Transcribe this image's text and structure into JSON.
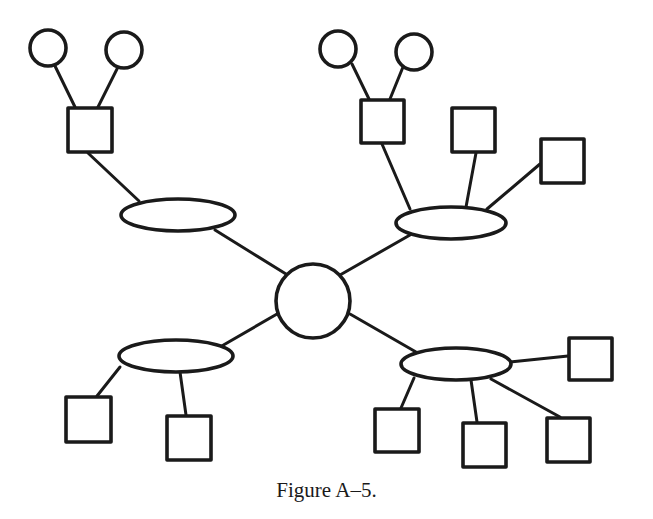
{
  "figure": {
    "caption": "Figure A–5.",
    "stroke_color": "#1a1a1a",
    "background": "#ffffff"
  },
  "diagram": {
    "hub": {
      "id": "hub",
      "shape": "circle",
      "cx": 313,
      "cy": 301,
      "r": 37
    },
    "ellipses": [
      {
        "id": "ellipse-top-left",
        "cx": 178,
        "cy": 215,
        "rx": 57,
        "ry": 16
      },
      {
        "id": "ellipse-top-right",
        "cx": 451,
        "cy": 223,
        "rx": 55,
        "ry": 16
      },
      {
        "id": "ellipse-bottom-left",
        "cx": 176,
        "cy": 356,
        "rx": 57,
        "ry": 16
      },
      {
        "id": "ellipse-bottom-right",
        "cx": 456,
        "cy": 364,
        "rx": 55,
        "ry": 16
      }
    ],
    "squares": [
      {
        "id": "square-tl-1",
        "x": 68,
        "y": 108,
        "w": 44,
        "h": 44
      },
      {
        "id": "square-tr-1",
        "x": 361,
        "y": 100,
        "w": 43,
        "h": 43
      },
      {
        "id": "square-tr-2",
        "x": 452,
        "y": 108,
        "w": 43,
        "h": 44
      },
      {
        "id": "square-tr-3",
        "x": 541,
        "y": 139,
        "w": 43,
        "h": 44
      },
      {
        "id": "square-bl-1",
        "x": 66,
        "y": 397,
        "w": 45,
        "h": 45
      },
      {
        "id": "square-bl-2",
        "x": 167,
        "y": 416,
        "w": 44,
        "h": 44
      },
      {
        "id": "square-br-1",
        "x": 569,
        "y": 338,
        "w": 43,
        "h": 42
      },
      {
        "id": "square-br-2",
        "x": 375,
        "y": 409,
        "w": 44,
        "h": 43
      },
      {
        "id": "square-br-3",
        "x": 463,
        "y": 423,
        "w": 43,
        "h": 44
      },
      {
        "id": "square-br-4",
        "x": 547,
        "y": 418,
        "w": 43,
        "h": 44
      }
    ],
    "small_circles": [
      {
        "id": "circle-tl-1",
        "cx": 48,
        "cy": 48,
        "r": 18
      },
      {
        "id": "circle-tl-2",
        "cx": 124,
        "cy": 50,
        "r": 18
      },
      {
        "id": "circle-tr-1",
        "cx": 338,
        "cy": 49,
        "r": 18
      },
      {
        "id": "circle-tr-2",
        "cx": 414,
        "cy": 52,
        "r": 18
      }
    ],
    "edges": [
      {
        "from": "circle-tl-1",
        "to": "square-tl-1",
        "x1": 55,
        "y1": 66,
        "x2": 75,
        "y2": 107
      },
      {
        "from": "circle-tl-2",
        "to": "square-tl-1",
        "x1": 118,
        "y1": 67,
        "x2": 98,
        "y2": 107
      },
      {
        "from": "square-tl-1",
        "to": "ellipse-top-left",
        "x1": 88,
        "y1": 153,
        "x2": 139,
        "y2": 201
      },
      {
        "from": "ellipse-top-left",
        "to": "hub",
        "x1": 215,
        "y1": 230,
        "x2": 286,
        "y2": 274
      },
      {
        "from": "circle-tr-1",
        "to": "square-tr-1",
        "x1": 352,
        "y1": 64,
        "x2": 369,
        "y2": 99
      },
      {
        "from": "circle-tr-2",
        "to": "square-tr-1",
        "x1": 403,
        "y1": 67,
        "x2": 390,
        "y2": 99
      },
      {
        "from": "square-tr-1",
        "to": "ellipse-top-right",
        "x1": 382,
        "y1": 144,
        "x2": 410,
        "y2": 209
      },
      {
        "from": "square-tr-2",
        "to": "ellipse-top-right",
        "x1": 476,
        "y1": 153,
        "x2": 466,
        "y2": 207
      },
      {
        "from": "square-tr-3",
        "to": "ellipse-top-right",
        "x1": 540,
        "y1": 164,
        "x2": 487,
        "y2": 209
      },
      {
        "from": "ellipse-top-right",
        "to": "hub",
        "x1": 410,
        "y1": 235,
        "x2": 340,
        "y2": 275
      },
      {
        "from": "hub",
        "to": "ellipse-bottom-left",
        "x1": 277,
        "y1": 314,
        "x2": 220,
        "y2": 347
      },
      {
        "from": "ellipse-bottom-left",
        "to": "square-bl-1",
        "x1": 120,
        "y1": 367,
        "x2": 97,
        "y2": 396
      },
      {
        "from": "ellipse-bottom-left",
        "to": "square-bl-2",
        "x1": 180,
        "y1": 372,
        "x2": 186,
        "y2": 415
      },
      {
        "from": "hub",
        "to": "ellipse-bottom-right",
        "x1": 350,
        "y1": 314,
        "x2": 416,
        "y2": 352
      },
      {
        "from": "ellipse-bottom-right",
        "to": "square-br-1",
        "x1": 510,
        "y1": 362,
        "x2": 568,
        "y2": 356
      },
      {
        "from": "ellipse-bottom-right",
        "to": "square-br-2",
        "x1": 414,
        "y1": 378,
        "x2": 401,
        "y2": 408
      },
      {
        "from": "ellipse-bottom-right",
        "to": "square-br-3",
        "x1": 471,
        "y1": 380,
        "x2": 477,
        "y2": 422
      },
      {
        "from": "ellipse-bottom-right",
        "to": "square-br-4",
        "x1": 491,
        "y1": 379,
        "x2": 560,
        "y2": 417
      }
    ]
  }
}
